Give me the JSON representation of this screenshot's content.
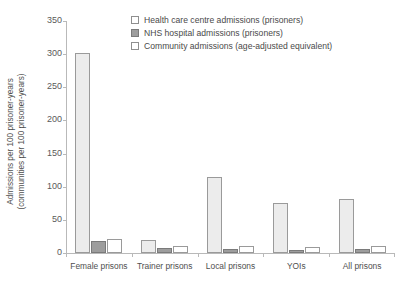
{
  "chart_data": {
    "type": "bar",
    "title": "",
    "xlabel": "",
    "ylabel": "Admissions per 100 prisoner-years\n(communities per 100 prisoner-years)",
    "ylim": [
      0,
      350
    ],
    "yticks": [
      0,
      50,
      100,
      150,
      200,
      250,
      300,
      350
    ],
    "grid": false,
    "legend_position": "top-right",
    "categories": [
      "Female prisons",
      "Trainer prisons",
      "Local prisons",
      "YOIs",
      "All prisons"
    ],
    "series": [
      {
        "name": "Health care centre admissions (prisoners)",
        "color": "#ececec",
        "values": [
          301,
          19,
          114,
          75,
          82
        ]
      },
      {
        "name": "NHS hospital admissions (prisoners)",
        "color": "#9d9d9d",
        "values": [
          18,
          8,
          6,
          5,
          6
        ]
      },
      {
        "name": "Community admissions (age-adjusted equivalent)",
        "color": "#ffffff",
        "values": [
          21,
          10,
          10,
          9,
          11
        ]
      }
    ]
  },
  "legend": {
    "items": [
      "Health care centre admissions (prisoners)",
      "NHS hospital admissions (prisoners)",
      "Community admissions (age-adjusted equivalent)"
    ]
  }
}
